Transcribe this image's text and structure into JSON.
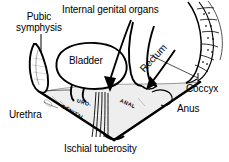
{
  "figure": {
    "view": "oblique perineal view",
    "background_color": "#ffffff",
    "line_color": "#000000"
  },
  "labels": {
    "pubic_symphysis": {
      "line1": "Pubic",
      "line2": "symphysis"
    },
    "internal_genital_organs": "Internal genital organs",
    "bladder": "Bladder",
    "rectum": "Rectum",
    "coccyx": "Coccyx",
    "anus": "Anus",
    "urethra": "Urethra",
    "ischial_tuberosity": "Ischial tuberosity",
    "urogenital_l1": "URO-",
    "urogenital_l2": "GENITAL",
    "anal": "ANAL"
  },
  "structures": [
    {
      "name": "pubic-symphysis",
      "label": "Pubic symphysis"
    },
    {
      "name": "bladder",
      "label": "Bladder"
    },
    {
      "name": "internal-genital-organs",
      "label": "Internal genital organs"
    },
    {
      "name": "rectum",
      "label": "Rectum"
    },
    {
      "name": "sacrum-coccyx",
      "label": "Coccyx"
    },
    {
      "name": "anus",
      "label": "Anus"
    },
    {
      "name": "urethra",
      "label": "Urethra"
    },
    {
      "name": "ischial-tuberosity",
      "label": "Ischial tuberosity"
    },
    {
      "name": "urogenital-triangle",
      "label": "URO-GENITAL"
    },
    {
      "name": "anal-triangle",
      "label": "ANAL"
    }
  ]
}
